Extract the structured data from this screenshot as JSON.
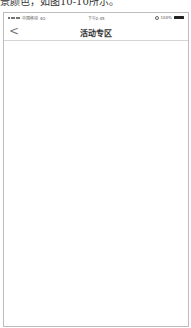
{
  "caption": "景颜色，如图10-10所示。",
  "status_bar": {
    "carrier": "中国移动 4G",
    "time": "下午2:45",
    "battery": "100%"
  },
  "nav": {
    "back_icon": "chevron-left-icon",
    "back_glyph": "<",
    "title": "活动专区"
  }
}
